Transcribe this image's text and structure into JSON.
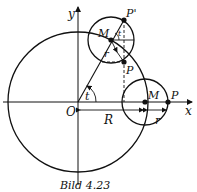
{
  "figure": {
    "caption": "Bild 4.23",
    "labels": {
      "x_axis": "x",
      "y_axis": "y",
      "origin": "O",
      "big_radius": "R",
      "small_radius": "r",
      "small_radius_rotated": "r",
      "angle": "t",
      "angle_small": "t",
      "center_lower": "M",
      "center_upper": "M",
      "point_lower": "P",
      "point_upper": "P",
      "point_upper_prime": "P'"
    },
    "colors": {
      "line": "#111111",
      "background": "#ffffff"
    }
  }
}
